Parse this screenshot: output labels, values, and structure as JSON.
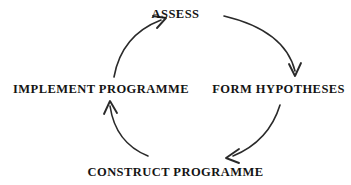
{
  "diagram": {
    "type": "cyclical-process",
    "direction": "clockwise",
    "background_color": "#ffffff",
    "stroke_color": "#2a2a2a",
    "text_color": "#141414",
    "nodes": [
      {
        "id": "assess",
        "label": "ASSESS",
        "position": "top"
      },
      {
        "id": "form-hypotheses",
        "label": "FORM HYPOTHESES",
        "position": "right"
      },
      {
        "id": "construct-programme",
        "label": "CONSTRUCT PROGRAMME",
        "position": "bottom"
      },
      {
        "id": "implement-programme",
        "label": "IMPLEMENT PROGRAMME",
        "position": "left"
      }
    ],
    "arrows": [
      {
        "id": "arrow-assess-to-hypotheses",
        "from": "assess",
        "to": "form-hypotheses",
        "arc": "top-right"
      },
      {
        "id": "arrow-hypotheses-to-construct",
        "from": "form-hypotheses",
        "to": "construct-programme",
        "arc": "bottom-right"
      },
      {
        "id": "arrow-construct-to-implement",
        "from": "construct-programme",
        "to": "implement-programme",
        "arc": "bottom-left"
      },
      {
        "id": "arrow-implement-to-assess",
        "from": "implement-programme",
        "to": "assess",
        "arc": "top-left"
      }
    ]
  }
}
